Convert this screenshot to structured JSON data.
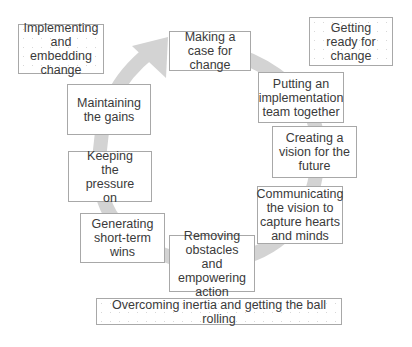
{
  "diagram": {
    "type": "cycle",
    "arrow_color": "#d3d3d3",
    "phases": [
      {
        "id": "getting-ready",
        "label": "Getting ready for change"
      },
      {
        "id": "overcoming-inertia",
        "label": "Overcoming inertia and getting the ball rolling"
      },
      {
        "id": "implementing",
        "label": "Implementing and embedding change"
      }
    ],
    "steps": [
      {
        "id": "making-case",
        "label": "Making a case for change"
      },
      {
        "id": "team",
        "label": "Putting an implementation team together"
      },
      {
        "id": "vision",
        "label": "Creating a vision for the future"
      },
      {
        "id": "communicating",
        "label": "Communicating the vision to capture hearts and minds"
      },
      {
        "id": "removing",
        "label": "Removing obstacles and empowering action"
      },
      {
        "id": "short-term",
        "label": "Generating short-term wins"
      },
      {
        "id": "pressure",
        "label": "Keeping the pressure on"
      },
      {
        "id": "gains",
        "label": "Maintaining the gains"
      }
    ]
  }
}
